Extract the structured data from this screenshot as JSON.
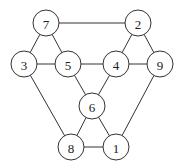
{
  "diagram": {
    "type": "graph",
    "node_radius": 13,
    "nodes": [
      {
        "id": "7",
        "label": "7",
        "x": 46,
        "y": 23
      },
      {
        "id": "2",
        "label": "2",
        "x": 138,
        "y": 23
      },
      {
        "id": "3",
        "label": "3",
        "x": 24,
        "y": 64
      },
      {
        "id": "5",
        "label": "5",
        "x": 68,
        "y": 64
      },
      {
        "id": "4",
        "label": "4",
        "x": 116,
        "y": 64
      },
      {
        "id": "9",
        "label": "9",
        "x": 160,
        "y": 64
      },
      {
        "id": "6",
        "label": "6",
        "x": 92,
        "y": 106
      },
      {
        "id": "8",
        "label": "8",
        "x": 71,
        "y": 147
      },
      {
        "id": "1",
        "label": "1",
        "x": 116,
        "y": 147
      }
    ],
    "edges": [
      [
        "7",
        "2"
      ],
      [
        "7",
        "3"
      ],
      [
        "7",
        "5"
      ],
      [
        "3",
        "5"
      ],
      [
        "5",
        "4"
      ],
      [
        "4",
        "9"
      ],
      [
        "2",
        "4"
      ],
      [
        "2",
        "9"
      ],
      [
        "3",
        "8"
      ],
      [
        "5",
        "6"
      ],
      [
        "4",
        "6"
      ],
      [
        "6",
        "8"
      ],
      [
        "6",
        "1"
      ],
      [
        "8",
        "1"
      ],
      [
        "9",
        "1"
      ]
    ]
  }
}
